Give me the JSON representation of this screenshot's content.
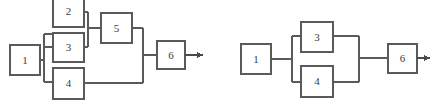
{
  "page": {
    "background_color": "#ffffff",
    "line_color": "#5a5a5a",
    "text_color": "#3b3b3b",
    "width": 432,
    "height": 111
  },
  "diagrams": [
    {
      "id": "left-diagram",
      "name": "series-parallel-block-diagram",
      "blocks": [
        {
          "id": "l1",
          "label": "1",
          "x": 10,
          "y": 45,
          "w": 30,
          "h": 30
        },
        {
          "id": "l2",
          "label": "2",
          "x": 53,
          "y": -4,
          "w": 31,
          "h": 31
        },
        {
          "id": "l3",
          "label": "3",
          "x": 53,
          "y": 33,
          "w": 31,
          "h": 29
        },
        {
          "id": "l4",
          "label": "4",
          "x": 53,
          "y": 68,
          "w": 31,
          "h": 31
        },
        {
          "id": "l5",
          "label": "5",
          "x": 101,
          "y": 13,
          "w": 31,
          "h": 30
        },
        {
          "id": "l6",
          "label": "6",
          "x": 157,
          "y": 41,
          "w": 28,
          "h": 28
        }
      ],
      "connectors": [
        "input-1-to-bus",
        "bus-to-2",
        "bus-to-3",
        "bus-to-4",
        "2-to-merge",
        "3-to-merge",
        "merge-to-5",
        "5-to-out-bus",
        "4-to-out-bus",
        "out-bus-to-6"
      ],
      "arrow": {
        "id": "l-arrow",
        "name": "output-arrow",
        "x1": 185,
        "y1": 55,
        "x2": 204,
        "y2": 55
      }
    },
    {
      "id": "right-diagram",
      "name": "simple-parallel-block-diagram",
      "blocks": [
        {
          "id": "r1",
          "label": "1",
          "x": 241,
          "y": 44,
          "w": 30,
          "h": 30
        },
        {
          "id": "r3",
          "label": "3",
          "x": 301,
          "y": 22,
          "w": 32,
          "h": 30
        },
        {
          "id": "r4",
          "label": "4",
          "x": 301,
          "y": 66,
          "w": 32,
          "h": 31
        },
        {
          "id": "r6",
          "label": "6",
          "x": 388,
          "y": 44,
          "w": 29,
          "h": 29
        }
      ],
      "connectors": [
        "input-1-to-bus",
        "bus-to-3",
        "bus-to-4",
        "3-to-merge",
        "4-to-merge",
        "merge-to-6"
      ],
      "arrow": {
        "id": "r-arrow",
        "name": "output-arrow",
        "x1": 417,
        "y1": 58,
        "x2": 430,
        "y2": 58
      }
    }
  ]
}
